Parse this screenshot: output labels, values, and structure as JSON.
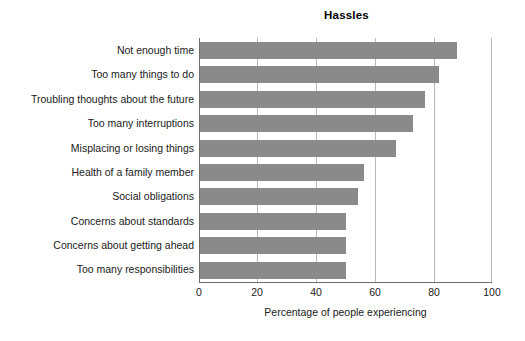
{
  "chart_data": {
    "type": "bar",
    "orientation": "horizontal",
    "title": "Hassles",
    "xlabel": "Percentage of people experiencing",
    "ylabel": "",
    "categories": [
      "Not enough time",
      "Too many things to do",
      "Troubling thoughts about the future",
      "Too many interruptions",
      "Misplacing or losing things",
      "Health of a family member",
      "Social obligations",
      "Concerns about standards",
      "Concerns about getting ahead",
      "Too many responsibilities"
    ],
    "values": [
      88,
      82,
      77,
      73,
      67,
      56,
      54,
      50,
      50,
      50
    ],
    "xlim": [
      0,
      100
    ],
    "xticks": [
      0,
      20,
      40,
      60,
      80,
      100
    ],
    "xtick_labels": [
      "0",
      "20",
      "40",
      "60",
      "80",
      "100"
    ],
    "grid": "vertical",
    "legend": "none",
    "bar_color": "#8a8a8a",
    "axis_color": "#6e6e6e",
    "gridline_color": "#b8b8b8",
    "background_color": "#ffffff"
  }
}
